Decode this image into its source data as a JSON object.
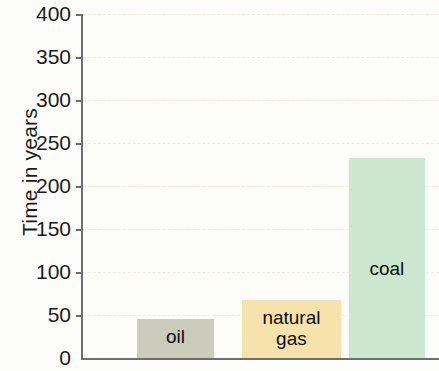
{
  "chart_data": {
    "type": "bar",
    "title": "",
    "xlabel": "",
    "ylabel": "Time in years",
    "ylim": [
      0,
      400
    ],
    "ytick_step": 50,
    "grid": true,
    "legend": "none",
    "categories": [
      "oil",
      "natural gas",
      "coal"
    ],
    "values": [
      45,
      67,
      232
    ],
    "ytick_labels": [
      "400",
      "350",
      "300",
      "250",
      "200",
      "150",
      "100",
      "50",
      "0"
    ],
    "ytick_values": [
      400,
      350,
      300,
      250,
      200,
      150,
      100,
      50,
      0
    ],
    "bars": [
      {
        "label": "oil",
        "label_display": "oil",
        "value": 45,
        "color": "#ccccbd",
        "x_start_pct": 15.1,
        "width_pct": 21.8,
        "label_bottom_px": 10
      },
      {
        "label": "natural gas",
        "label_display": "natural\ngas",
        "value": 67,
        "color": "#f5e3ab",
        "x_start_pct": 44.7,
        "width_pct": 27.7,
        "label_bottom_px": 8
      },
      {
        "label": "coal",
        "label_display": "coal",
        "value": 232,
        "color": "#cbe8ce",
        "x_start_pct": 74.6,
        "width_pct": 21.5,
        "label_bottom_px": 78
      }
    ],
    "colors": {
      "oil": "#ccccbd",
      "natural_gas": "#f5e3ab",
      "coal": "#cbe8ce",
      "axis": "#6e6e6e",
      "gridline": "#f0ebdd",
      "text": "#1a1a1a",
      "background": "#fdfdfb"
    }
  }
}
